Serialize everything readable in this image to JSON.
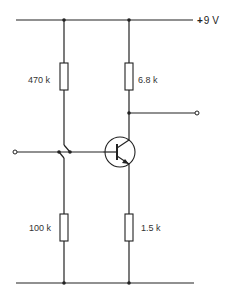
{
  "diagram": {
    "type": "circuit",
    "supply": {
      "sign": "+",
      "label": "9 V"
    },
    "components": {
      "r1": {
        "label": "470 k",
        "role": "upper base bias resistor"
      },
      "r2": {
        "label": "100 k",
        "role": "lower base bias resistor"
      },
      "rc": {
        "label": "6.8 k",
        "role": "collector resistor"
      },
      "re": {
        "label": "1.5 k",
        "role": "emitter resistor"
      },
      "q1": {
        "label": "",
        "role": "NPN transistor"
      }
    },
    "terminals": [
      "input",
      "output"
    ]
  }
}
